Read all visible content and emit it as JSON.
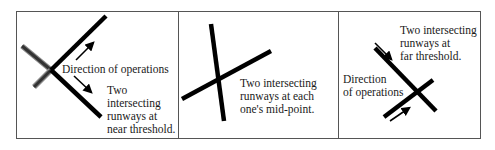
{
  "figure": {
    "panels": [
      {
        "id": "near-threshold",
        "direction_label": "Direction of operations",
        "description": "Two\nintersecting\nrunways at\nnear threshold."
      },
      {
        "id": "mid-point",
        "description": "Two intersecting\nrunways at each\none's mid-point."
      },
      {
        "id": "far-threshold",
        "description": "Two intersecting\nrunways at\nfar threshold.",
        "direction_label": "Direction\nof operations"
      }
    ],
    "colors": {
      "runway": "#000000",
      "runway_secondary": "#3a3a3a",
      "border": "#555555",
      "text": "#1a1a1a"
    }
  }
}
